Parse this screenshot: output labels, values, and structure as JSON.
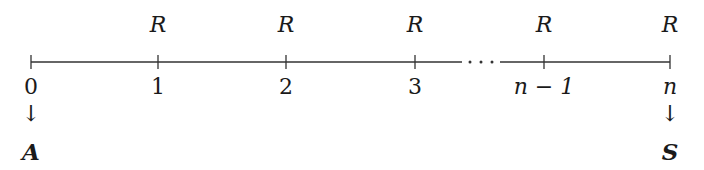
{
  "diagram": {
    "type": "cash-flow timeline",
    "payments": [
      {
        "label": "R",
        "period": "1"
      },
      {
        "label": "R",
        "period": "2"
      },
      {
        "label": "R",
        "period": "3"
      },
      {
        "label": "R",
        "period": "n − 1"
      },
      {
        "label": "R",
        "period": "n"
      }
    ],
    "ticks": [
      {
        "label": "0",
        "x": 31
      },
      {
        "label": "1",
        "x": 158
      },
      {
        "label": "2",
        "x": 286
      },
      {
        "label": "3",
        "x": 415
      },
      {
        "label": "n − 1",
        "x": 544
      },
      {
        "label": "n",
        "x": 670
      }
    ],
    "ellipsis": "· · ·",
    "start_arrow": "↓",
    "start_value": "A",
    "end_arrow": "↓",
    "end_value": "S",
    "line_color": "#333333"
  }
}
